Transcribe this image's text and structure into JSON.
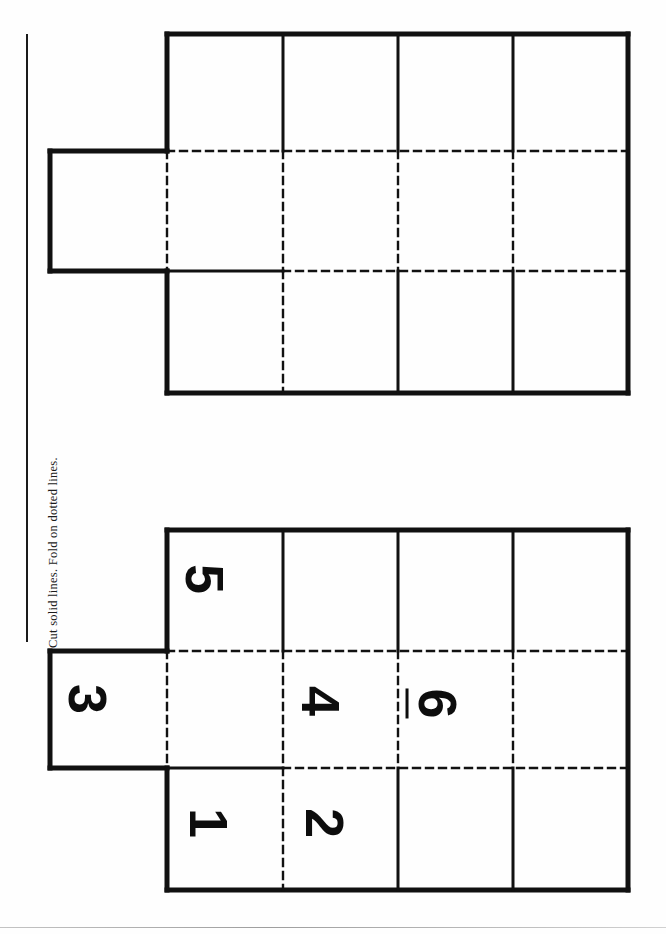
{
  "document": {
    "title": "Cube Net Cut-and-Fold Worksheet",
    "instruction": "Cut solid lines. Fold on dotted lines.",
    "orientation": "rotated-90",
    "background_color": "#ffffff",
    "line_color": "#111111"
  },
  "nets": [
    {
      "id": "net-blank",
      "label": "blank-net",
      "numbered": false,
      "cells": [
        {
          "id": "t-r1c1",
          "number": ""
        },
        {
          "id": "t-r1c2",
          "number": ""
        },
        {
          "id": "t-r1c3",
          "number": ""
        },
        {
          "id": "t-r1c4",
          "number": ""
        },
        {
          "id": "t-r2c0",
          "number": ""
        },
        {
          "id": "t-r2c1",
          "number": ""
        },
        {
          "id": "t-r2c2",
          "number": ""
        },
        {
          "id": "t-r2c3",
          "number": ""
        },
        {
          "id": "t-r2c4",
          "number": ""
        },
        {
          "id": "t-r3c1",
          "number": ""
        },
        {
          "id": "t-r3c2",
          "number": ""
        },
        {
          "id": "t-r3c3",
          "number": ""
        },
        {
          "id": "t-r3c4",
          "number": ""
        }
      ]
    },
    {
      "id": "net-numbered",
      "label": "numbered-net",
      "numbered": true,
      "cells": [
        {
          "id": "b-r1c1",
          "number": "5"
        },
        {
          "id": "b-r1c2",
          "number": ""
        },
        {
          "id": "b-r1c3",
          "number": ""
        },
        {
          "id": "b-r1c4",
          "number": ""
        },
        {
          "id": "b-r2c0",
          "number": "3"
        },
        {
          "id": "b-r2c1",
          "number": ""
        },
        {
          "id": "b-r2c2",
          "number": "4"
        },
        {
          "id": "b-r2c3",
          "number": "6"
        },
        {
          "id": "b-r2c4",
          "number": ""
        },
        {
          "id": "b-r3c1",
          "number": "1"
        },
        {
          "id": "b-r3c2",
          "number": "2"
        },
        {
          "id": "b-r3c3",
          "number": ""
        },
        {
          "id": "b-r3c4",
          "number": ""
        }
      ]
    }
  ],
  "numbers": {
    "one": "1",
    "two": "2",
    "three": "3",
    "four": "4",
    "five": "5",
    "six": "6"
  }
}
